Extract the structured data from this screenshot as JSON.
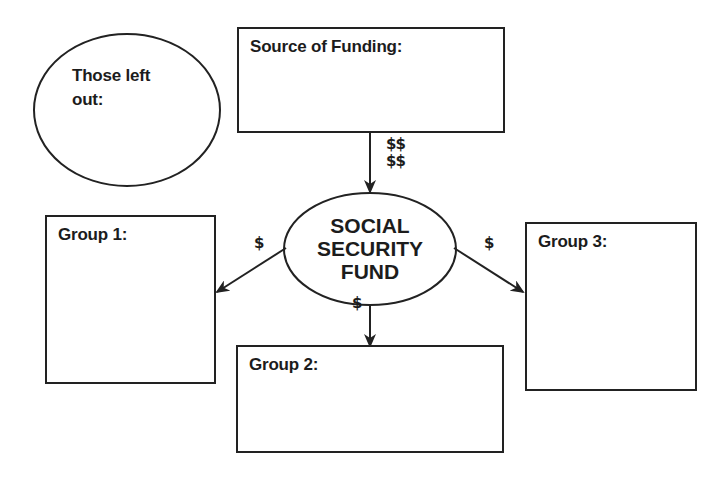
{
  "diagram": {
    "type": "flow_graphic_organizer",
    "excluded_oval": {
      "label_line1": "Those left",
      "label_line2": "out:"
    },
    "source_box": {
      "label": "Source of Funding:"
    },
    "central_node": {
      "line1": "SOCIAL",
      "line2": "SECURITY",
      "line3": "FUND"
    },
    "groups": [
      {
        "label": "Group 1:"
      },
      {
        "label": "Group 2:"
      },
      {
        "label": "Group 3:"
      }
    ],
    "flows": {
      "source_to_fund_line1": "$$",
      "source_to_fund_line2": "$$",
      "fund_to_group1": "$",
      "fund_to_group2": "$",
      "fund_to_group3": "$"
    },
    "colors": {
      "stroke": "#222222",
      "text": "#1c1c1c",
      "background": "#ffffff"
    }
  }
}
